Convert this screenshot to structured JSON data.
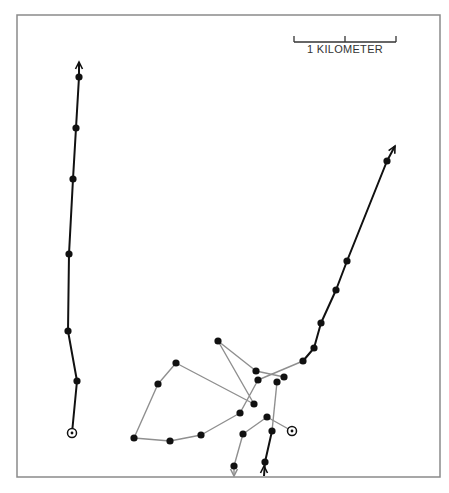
{
  "figure": {
    "frame": {
      "x": 17,
      "y": 15,
      "width": 423,
      "height": 462,
      "color": "#8a8a8a"
    },
    "scale_bar": {
      "label": "1 KILOMETER",
      "x1": 294,
      "x2": 396,
      "y": 42,
      "mid_x": 345,
      "color": "#333333"
    },
    "colors": {
      "black_track": "#111111",
      "gray_track": "#8f8f8f",
      "dot": "#111111"
    },
    "tracks": [
      {
        "name": "left-track",
        "style": "black",
        "start_marker": [
          72,
          433
        ],
        "points": [
          [
            72,
            433
          ],
          [
            77,
            381
          ],
          [
            68,
            331
          ],
          [
            69,
            254
          ],
          [
            73,
            179
          ],
          [
            76,
            128
          ],
          [
            79,
            77
          ],
          [
            79,
            62
          ]
        ],
        "arrow_end": true
      },
      {
        "name": "right-track",
        "style": "black",
        "points": [
          [
            303,
            361
          ],
          [
            314,
            348
          ],
          [
            321,
            323
          ],
          [
            336,
            290
          ],
          [
            347,
            261
          ],
          [
            387,
            161
          ],
          [
            395,
            146
          ]
        ],
        "arrow_end": true
      },
      {
        "name": "bottom-black-track",
        "style": "black",
        "points": [
          [
            264,
            476
          ],
          [
            265,
            462
          ],
          [
            272,
            431
          ]
        ],
        "arrow_at": [
          264,
          466
        ]
      },
      {
        "name": "gray-track-loop",
        "style": "gray",
        "points": [
          [
            303,
            361
          ],
          [
            258,
            380
          ],
          [
            240,
            413
          ],
          [
            201,
            435
          ],
          [
            170,
            441
          ],
          [
            134,
            438
          ],
          [
            158,
            384
          ],
          [
            176,
            363
          ],
          [
            254,
            404
          ],
          [
            218,
            341
          ],
          [
            256,
            371
          ],
          [
            284,
            377
          ]
        ]
      },
      {
        "name": "gray-track-connector",
        "style": "gray",
        "points": [
          [
            277,
            382
          ],
          [
            272,
            431
          ]
        ]
      },
      {
        "name": "gray-track-south",
        "style": "gray",
        "start_marker": [
          292,
          431
        ],
        "points": [
          [
            292,
            431
          ],
          [
            267,
            417
          ],
          [
            243,
            434
          ],
          [
            234,
            466
          ],
          [
            234,
            476
          ]
        ],
        "arrow_end": true
      }
    ],
    "dots": [
      [
        79,
        77
      ],
      [
        76,
        128
      ],
      [
        73,
        179
      ],
      [
        69,
        254
      ],
      [
        68,
        331
      ],
      [
        77,
        381
      ],
      [
        387,
        161
      ],
      [
        347,
        261
      ],
      [
        336,
        290
      ],
      [
        321,
        323
      ],
      [
        314,
        348
      ],
      [
        303,
        361
      ],
      [
        218,
        341
      ],
      [
        176,
        363
      ],
      [
        158,
        384
      ],
      [
        134,
        438
      ],
      [
        170,
        441
      ],
      [
        201,
        435
      ],
      [
        240,
        413
      ],
      [
        254,
        404
      ],
      [
        256,
        371
      ],
      [
        258,
        380
      ],
      [
        277,
        382
      ],
      [
        284,
        377
      ],
      [
        267,
        417
      ],
      [
        243,
        434
      ],
      [
        234,
        466
      ],
      [
        272,
        431
      ],
      [
        265,
        462
      ]
    ],
    "start_markers": [
      [
        72,
        433
      ],
      [
        292,
        431
      ]
    ]
  }
}
